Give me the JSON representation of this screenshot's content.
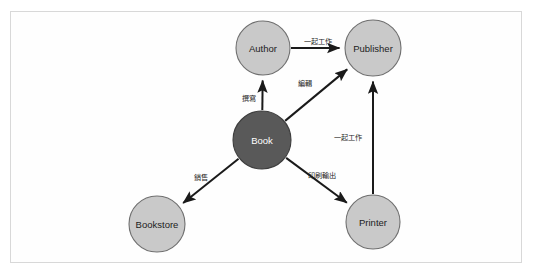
{
  "figure": {
    "frame": {
      "border_color": "#d8d8d8",
      "background": "#fefefe"
    },
    "palette": {
      "node_light_fill": "#c9c9c9",
      "node_dark_fill": "#595959",
      "node_stroke": "#6f6f6f",
      "edge_color": "#1a1a1a",
      "label_dark_text": "#1c1c1c",
      "label_light_text": "#ffffff"
    }
  },
  "diagram": {
    "type": "node-link-graph",
    "nodes": [
      {
        "id": "author",
        "label": "Author",
        "cx": 263,
        "cy": 48,
        "r": 27,
        "style": "light"
      },
      {
        "id": "publisher",
        "label": "Publisher",
        "cx": 373,
        "cy": 48,
        "r": 28,
        "style": "light"
      },
      {
        "id": "book",
        "label": "Book",
        "cx": 262,
        "cy": 140,
        "r": 29,
        "style": "dark"
      },
      {
        "id": "bookstore",
        "label": "Bookstore",
        "cx": 157,
        "cy": 224,
        "r": 28,
        "style": "light"
      },
      {
        "id": "printer",
        "label": "Printer",
        "cx": 373,
        "cy": 222,
        "r": 27,
        "style": "light"
      }
    ],
    "edges": [
      {
        "id": "author-publisher",
        "from": "author",
        "to": "publisher",
        "label": "一起工作",
        "label_x": 318,
        "label_y": 41,
        "arrow": "end"
      },
      {
        "id": "book-author",
        "from": "book",
        "to": "author",
        "label": "撰寫",
        "label_x": 249,
        "label_y": 98,
        "arrow": "end"
      },
      {
        "id": "book-publisher",
        "from": "book",
        "to": "publisher",
        "label": "編輯",
        "label_x": 305,
        "label_y": 83,
        "arrow": "end"
      },
      {
        "id": "book-bookstore",
        "from": "book",
        "to": "bookstore",
        "label": "銷售",
        "label_x": 201,
        "label_y": 177,
        "arrow": "end"
      },
      {
        "id": "book-printer",
        "from": "book",
        "to": "printer",
        "label": "印刷輸出",
        "label_x": 322,
        "label_y": 175,
        "arrow": "end"
      },
      {
        "id": "printer-publisher",
        "from": "printer",
        "to": "publisher",
        "label": "一起工作",
        "label_x": 348,
        "label_y": 137,
        "arrow": "end"
      }
    ]
  }
}
